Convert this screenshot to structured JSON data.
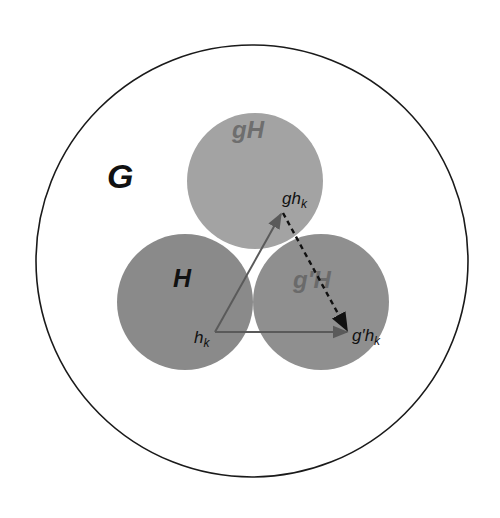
{
  "diagram": {
    "group_label": "G",
    "cosets": [
      {
        "id": "H",
        "label": "H",
        "fill": "#8a8a8a",
        "label_color": "#111111"
      },
      {
        "id": "gH",
        "label": "gH",
        "fill": "#a3a3a3",
        "label_color": "#6e6e6e"
      },
      {
        "id": "gpH",
        "label": "g′H",
        "fill": "#8f8f8f",
        "label_color": "#6a6a6a"
      }
    ],
    "points": {
      "hk": {
        "base": "h",
        "sub": "k"
      },
      "ghk": {
        "base": "gh",
        "sub": "k"
      },
      "gphk": {
        "base": "g′h",
        "sub": "k"
      }
    },
    "colors": {
      "outline": "#1a1a1a",
      "arrow_solid": "#5a5a5a",
      "arrow_dashed": "#111111"
    }
  }
}
